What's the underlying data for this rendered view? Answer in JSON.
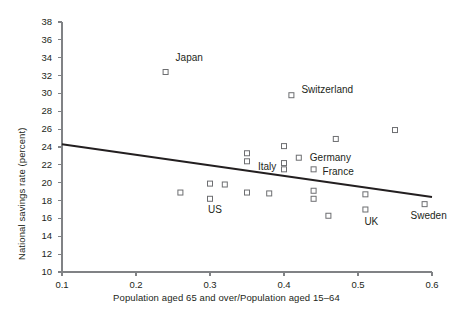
{
  "chart_data": {
    "type": "scatter",
    "title": "",
    "xlabel": "Population aged 65 and over/Population aged 15–64",
    "ylabel": "National savings rate (percent)",
    "xlim": [
      0.1,
      0.6
    ],
    "ylim": [
      10,
      38
    ],
    "xticks": [
      "0.1",
      "0.2",
      "0.3",
      "0.4",
      "0.5",
      "0.6"
    ],
    "xtick_values": [
      0.1,
      0.2,
      0.3,
      0.4,
      0.5,
      0.6
    ],
    "yticks": [
      "10",
      "12",
      "14",
      "16",
      "18",
      "20",
      "22",
      "24",
      "26",
      "28",
      "30",
      "32",
      "34",
      "36",
      "38"
    ],
    "ytick_values": [
      10,
      12,
      14,
      16,
      18,
      20,
      22,
      24,
      26,
      28,
      30,
      32,
      34,
      36,
      38
    ],
    "grid": false,
    "legend": "none",
    "marker": "open-square",
    "marker_color": "#6d6e71",
    "line_color": "#231f20",
    "points": [
      {
        "x": 0.24,
        "y": 32.4,
        "label": "Japan",
        "label_dx": 10,
        "label_dy": -14
      },
      {
        "x": 0.41,
        "y": 29.8,
        "label": "Switzerland",
        "label_dx": 10,
        "label_dy": -5
      },
      {
        "x": 0.55,
        "y": 25.9,
        "label": "",
        "label_dx": 0,
        "label_dy": 0
      },
      {
        "x": 0.47,
        "y": 24.9,
        "label": "",
        "label_dx": 0,
        "label_dy": 0
      },
      {
        "x": 0.4,
        "y": 24.1,
        "label": "",
        "label_dx": 0,
        "label_dy": 0
      },
      {
        "x": 0.35,
        "y": 23.3,
        "label": "",
        "label_dx": 0,
        "label_dy": 0
      },
      {
        "x": 0.42,
        "y": 22.8,
        "label": "Germany",
        "label_dx": 11,
        "label_dy": 0
      },
      {
        "x": 0.35,
        "y": 22.4,
        "label": "",
        "label_dx": 0,
        "label_dy": 0
      },
      {
        "x": 0.4,
        "y": 22.2,
        "label": "",
        "label_dx": 0,
        "label_dy": 0
      },
      {
        "x": 0.4,
        "y": 21.5,
        "label": "Italy",
        "label_dx": -26,
        "label_dy": -2
      },
      {
        "x": 0.44,
        "y": 21.5,
        "label": "France",
        "label_dx": 9,
        "label_dy": 3
      },
      {
        "x": 0.3,
        "y": 19.9,
        "label": "",
        "label_dx": 0,
        "label_dy": 0
      },
      {
        "x": 0.32,
        "y": 19.8,
        "label": "",
        "label_dx": 0,
        "label_dy": 0
      },
      {
        "x": 0.44,
        "y": 19.1,
        "label": "",
        "label_dx": 0,
        "label_dy": 0
      },
      {
        "x": 0.26,
        "y": 18.9,
        "label": "",
        "label_dx": 0,
        "label_dy": 0
      },
      {
        "x": 0.35,
        "y": 18.9,
        "label": "",
        "label_dx": 0,
        "label_dy": 0
      },
      {
        "x": 0.38,
        "y": 18.8,
        "label": "",
        "label_dx": 0,
        "label_dy": 0
      },
      {
        "x": 0.51,
        "y": 18.7,
        "label": "",
        "label_dx": 0,
        "label_dy": 0
      },
      {
        "x": 0.3,
        "y": 18.2,
        "label": "US",
        "label_dx": -2,
        "label_dy": 11
      },
      {
        "x": 0.44,
        "y": 18.2,
        "label": "",
        "label_dx": 0,
        "label_dy": 0
      },
      {
        "x": 0.59,
        "y": 17.6,
        "label": "Sweden",
        "label_dx": -14,
        "label_dy": 12
      },
      {
        "x": 0.51,
        "y": 17.0,
        "label": "UK",
        "label_dx": -1,
        "label_dy": 12
      },
      {
        "x": 0.46,
        "y": 16.3,
        "label": "",
        "label_dx": 0,
        "label_dy": 0
      }
    ],
    "trendline": {
      "x0": 0.1,
      "y0": 24.3,
      "x1": 0.6,
      "y1": 18.4
    }
  }
}
